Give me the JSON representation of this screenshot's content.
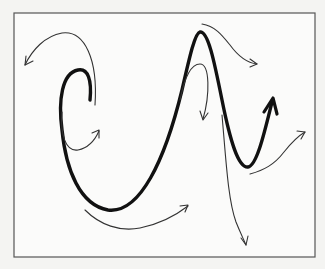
{
  "figure": {
    "colors": {
      "background": "#f4f4f2",
      "frame": "#555555",
      "main_curve": "#111111",
      "annotation_arrows": "#333333"
    },
    "main_curve": {
      "name": "main-trajectory",
      "path": "M90,100 C92,80 88,68 78,70 C62,73 58,100 62,130 C66,170 80,205 108,210 C140,214 165,160 182,90 C190,55 195,33 200,32 C208,31 214,60 222,100 C230,140 238,168 248,167 C257,166 265,130 272,102",
      "arrowhead": "M264,112 L273,98 L277,114"
    },
    "annotation_arrows": [
      {
        "name": "arrow-top-left",
        "path": "M95,105 C98,60 85,30 62,33 C45,36 32,50 25,65",
        "head": "M26,56 L25,65 L33,61"
      },
      {
        "name": "arrow-inner-hook",
        "path": "M62,112 C60,135 66,152 78,150 C88,148 95,140 99,131",
        "head": "M92,133 L99,130 L99,138"
      },
      {
        "name": "arrow-bottom",
        "path": "M85,210 C100,225 120,232 140,228 C160,224 175,216 188,206",
        "head": "M180,206 L188,205 L185,212"
      },
      {
        "name": "arrow-peak-top",
        "path": "M202,24 C215,26 222,35 230,45 C238,56 248,63 257,64",
        "head": "M250,59 L257,64 L250,67"
      },
      {
        "name": "arrow-inside-peak",
        "path": "M180,100 C184,80 190,64 200,64 C210,64 210,95 203,119",
        "head": "M200,111 L203,120 L208,113"
      },
      {
        "name": "arrow-long-drop",
        "path": "M222,115 C226,160 228,200 236,222 C240,232 243,238 246,245",
        "head": "M241,238 L246,245 L248,236"
      },
      {
        "name": "arrow-valley",
        "path": "M250,174 C264,170 274,165 284,152 C292,142 298,136 305,132",
        "head": "M297,131 L305,132 L301,139"
      }
    ]
  }
}
